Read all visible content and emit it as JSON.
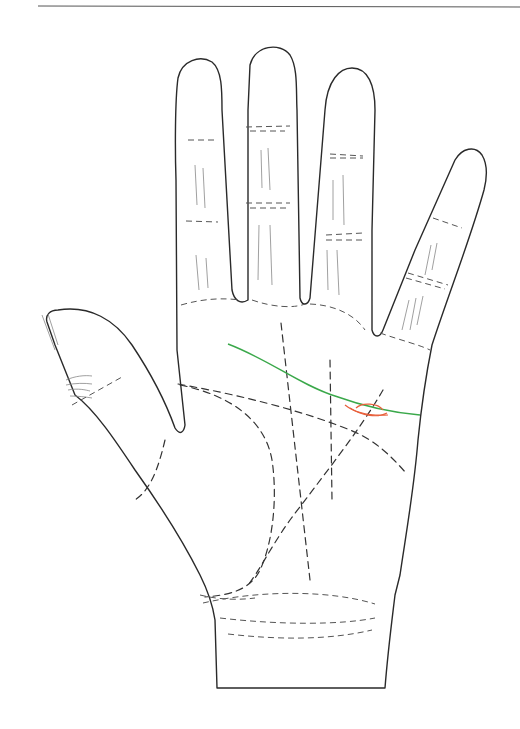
{
  "figure": {
    "top_rule": true,
    "colors": {
      "outline": "#2a2a2a",
      "dashed_lines": "#333333",
      "highlight_line": "#3aa84a",
      "marker": "#e8603c"
    },
    "highlighted_line": "heart-line",
    "marker_shape": "island"
  }
}
